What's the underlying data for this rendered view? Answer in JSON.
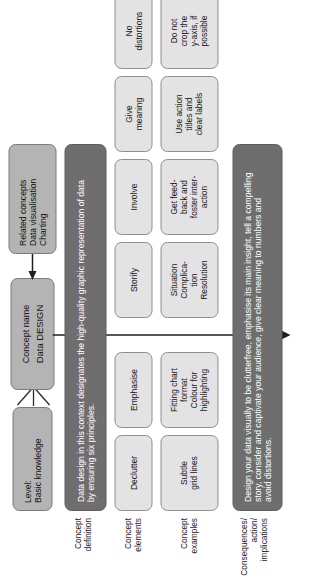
{
  "diagram": {
    "colors": {
      "light_box": "#e3e3e3",
      "mid_box": "#b4b4b4",
      "dark_box": "#6e6e6e",
      "border": "#8f8f8f",
      "text": "#1a1a1a",
      "inverse_text": "#ffffff",
      "background": "#ffffff"
    },
    "header": {
      "level": {
        "label": "Level:",
        "value": "Basic knowledge",
        "lines": [
          "Level:",
          "Basic knowledge"
        ]
      },
      "concept_name": {
        "label": "Concept name",
        "value": "Data DESIGN"
      },
      "related_concepts": {
        "label": "Related concepts",
        "items": [
          "Data visualisation",
          "Charting"
        ],
        "lines": [
          "Related concepts",
          "Data visualisation",
          "Charting"
        ]
      }
    },
    "rows": [
      {
        "key": "definition",
        "label_lines": [
          "Concept",
          "definition"
        ],
        "text": "Data design in this context designates the high-quality graphic representation of data by ensuring six principles.",
        "lines": [
          "Data design in this context designates the high-quality graphic representation of data",
          "by ensuring six principles."
        ]
      },
      {
        "key": "elements",
        "label_lines": [
          "Concept",
          "elements"
        ],
        "items": [
          {
            "lines": [
              "Declutter"
            ]
          },
          {
            "lines": [
              "Emphasise"
            ]
          },
          {
            "lines": [
              "Storify"
            ]
          },
          {
            "lines": [
              "Involve"
            ]
          },
          {
            "lines": [
              "Give",
              "meaning"
            ]
          },
          {
            "lines": [
              "No",
              "distortions"
            ]
          }
        ]
      },
      {
        "key": "examples",
        "label_lines": [
          "Concept",
          "examples"
        ],
        "items": [
          {
            "lines": [
              "Subtle",
              "grid lines"
            ]
          },
          {
            "lines": [
              "Fitting chart",
              "format",
              "Colour for",
              "highlighting"
            ]
          },
          {
            "lines": [
              "Situation",
              "Complica-",
              "tion",
              "Resolution"
            ]
          },
          {
            "lines": [
              "Get feed-",
              "back and",
              "foster inter-",
              "action"
            ]
          },
          {
            "lines": [
              "Use action",
              "titles and",
              "clear labels"
            ]
          },
          {
            "lines": [
              "Do not",
              "crop the",
              "y-axis, if",
              "possible"
            ]
          }
        ]
      },
      {
        "key": "consequences",
        "label_lines": [
          "Consequences/",
          "action/",
          "implications"
        ],
        "text": "Design your data visually to be clutterfree, emphasise its main insight, tell a compelling story, consider and captivate your audience, give clear meaning to numbers and avoid distortions.",
        "lines": [
          "Design your data visually to be clutterfree, emphasise its main insight, tell a compelling",
          "story, consider and captivate your audience, give clear meaning to numbers and",
          "avoid distortions."
        ]
      }
    ]
  }
}
